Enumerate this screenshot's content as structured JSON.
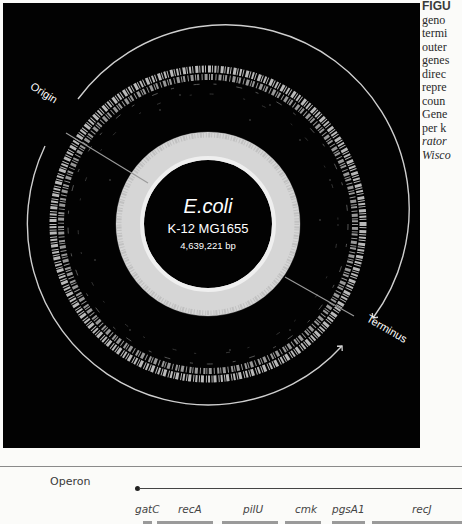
{
  "figure": {
    "genome_name": "E.coli",
    "strain": "K-12  MG1655",
    "genome_size": "4,639,221 bp",
    "origin_label": "Origin",
    "terminus_label": "Terminus",
    "colors": {
      "background": "#020202",
      "ring": "#e6e6e6",
      "gc_ring": "#d8d8d8",
      "text": "#ffffff"
    }
  },
  "caption": {
    "lines": [
      {
        "text": "FIGU",
        "style": "head"
      },
      {
        "text": "geno",
        "style": "normal"
      },
      {
        "text": "termi",
        "style": "normal"
      },
      {
        "text": "outer",
        "style": "normal"
      },
      {
        "text": "genes",
        "style": "normal"
      },
      {
        "text": "direc",
        "style": "normal"
      },
      {
        "text": "repre",
        "style": "normal"
      },
      {
        "text": "coun",
        "style": "normal"
      },
      {
        "text": "Gene",
        "style": "normal"
      },
      {
        "text": "per k",
        "style": "normal"
      },
      {
        "text": "rator",
        "style": "italic"
      },
      {
        "text": "Wisco",
        "style": "italic"
      }
    ]
  },
  "operon": {
    "label": "Operon",
    "genes": [
      {
        "name": "gatC",
        "label_x": 135,
        "bar_x": 143,
        "bar_w": 9
      },
      {
        "name": "recA",
        "label_x": 178,
        "bar_x": 157,
        "bar_w": 56
      },
      {
        "name": "pilU",
        "label_x": 243,
        "bar_x": 222,
        "bar_w": 56
      },
      {
        "name": "cmk",
        "label_x": 295,
        "bar_x": 285,
        "bar_w": 36
      },
      {
        "name": "pgsA1",
        "label_x": 332,
        "bar_x": 332,
        "bar_w": 33
      },
      {
        "name": "recJ",
        "label_x": 412,
        "bar_x": 372,
        "bar_w": 90
      }
    ]
  }
}
